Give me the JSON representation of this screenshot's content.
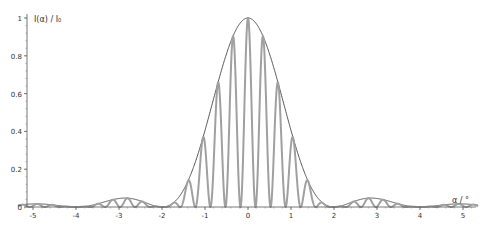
{
  "chart_data": {
    "type": "line",
    "title": "",
    "xlabel": "α / °",
    "ylabel": "I(α) / I₀",
    "xlim": [
      -5.35,
      5.35
    ],
    "ylim": [
      0,
      1
    ],
    "grid": false,
    "legend": null,
    "x_ticks": [
      -5,
      -4,
      -3,
      -2,
      -1,
      0,
      1,
      2,
      3,
      4,
      5
    ],
    "x_tick_labels": [
      "-5",
      "-4",
      "-3",
      "-2",
      "-1",
      "0",
      "1",
      "2",
      "3",
      "4",
      "5"
    ],
    "y_ticks": [
      0,
      0.2,
      0.4,
      0.6,
      0.8,
      1
    ],
    "y_tick_labels": [
      "0",
      "0.2",
      "0.4",
      "0.6",
      "0.8",
      "1"
    ],
    "series": [
      {
        "name": "envelope (single-slit)",
        "color": "#444444",
        "description": "sinc² envelope, zeros at ±2 and ±4",
        "key_points": [
          {
            "x": 0,
            "y": 1.0
          },
          {
            "x": -2,
            "y": 0.0
          },
          {
            "x": 2,
            "y": 0.0
          },
          {
            "x": -2.9,
            "y": 0.045
          },
          {
            "x": 2.9,
            "y": 0.045
          },
          {
            "x": -4,
            "y": 0.0
          },
          {
            "x": 4,
            "y": 0.0
          },
          {
            "x": -5,
            "y": 0.016
          },
          {
            "x": 5,
            "y": 0.016
          }
        ]
      },
      {
        "name": "intensity (multi-slit fringes)",
        "color": "#a0a0a0",
        "description": "interference fringes modulated by envelope; fringe period ≈0.35",
        "peak_points": [
          {
            "x": 0,
            "y": 1.0
          },
          {
            "x": 0.35,
            "y": 0.88
          },
          {
            "x": -0.35,
            "y": 0.88
          },
          {
            "x": 0.7,
            "y": 0.6
          },
          {
            "x": -0.7,
            "y": 0.6
          },
          {
            "x": 1.05,
            "y": 0.3
          },
          {
            "x": -1.05,
            "y": 0.3
          },
          {
            "x": 1.4,
            "y": 0.08
          },
          {
            "x": -1.4,
            "y": 0.08
          }
        ]
      }
    ]
  },
  "axes": {
    "xlabel": "α / °",
    "ylabel": "I(α) / I₀"
  }
}
